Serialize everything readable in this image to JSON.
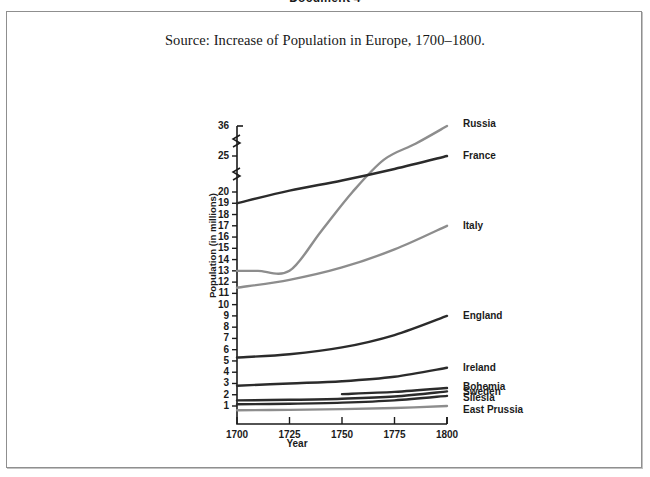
{
  "document": {
    "heading": "Document 4",
    "caption": "Source: Increase of Population in Europe, 1700–1800."
  },
  "chart_data": {
    "type": "line",
    "title": "Source: Increase of Population in Europe, 1700–1800.",
    "xlabel": "Year",
    "ylabel": "Population (in millions)",
    "xlim": [
      1700,
      1800
    ],
    "x_ticks": [
      "1700",
      "1725",
      "1750",
      "1775",
      "1800"
    ],
    "y_ticks": [
      "1",
      "2",
      "3",
      "4",
      "5",
      "6",
      "7",
      "8",
      "9",
      "10",
      "11",
      "12",
      "13",
      "14",
      "15",
      "16",
      "17",
      "18",
      "19",
      "20",
      "25",
      "36"
    ],
    "y_axis_breaks": [
      "between 20 and 25",
      "between 25 and 36"
    ],
    "grid": false,
    "legend_position": "right-of-line-ends",
    "series": [
      {
        "name": "Russia",
        "color": "#8d8d8d",
        "label_value": "36",
        "x": [
          1700,
          1710,
          1725,
          1740,
          1755,
          1770,
          1785,
          1800
        ],
        "values": [
          13,
          13,
          13,
          16.5,
          20,
          24.5,
          29.5,
          36
        ]
      },
      {
        "name": "France",
        "color": "#2b2b2b",
        "label_value": "25",
        "x": [
          1700,
          1725,
          1750,
          1775,
          1800
        ],
        "values": [
          19,
          20.2,
          21.6,
          23.2,
          25
        ]
      },
      {
        "name": "Italy",
        "color": "#8d8d8d",
        "label_value": "17",
        "x": [
          1700,
          1725,
          1750,
          1775,
          1800
        ],
        "values": [
          11.5,
          12.2,
          13.3,
          14.9,
          17
        ]
      },
      {
        "name": "England",
        "color": "#2b2b2b",
        "label_value": "9",
        "x": [
          1700,
          1725,
          1750,
          1775,
          1800
        ],
        "values": [
          5.3,
          5.6,
          6.2,
          7.3,
          9.0
        ]
      },
      {
        "name": "Ireland",
        "color": "#2b2b2b",
        "label_value": "4.4",
        "x": [
          1700,
          1725,
          1750,
          1775,
          1800
        ],
        "values": [
          2.8,
          3.0,
          3.2,
          3.6,
          4.4
        ]
      },
      {
        "name": "Bohemia",
        "color": "#2b2b2b",
        "label_value": "2.6",
        "x": [
          1750,
          1775,
          1800
        ],
        "values": [
          2.05,
          2.25,
          2.6
        ]
      },
      {
        "name": "Sweden",
        "color": "#2b2b2b",
        "label_value": "2.3",
        "x": [
          1700,
          1725,
          1750,
          1775,
          1800
        ],
        "values": [
          1.5,
          1.55,
          1.65,
          1.85,
          2.3
        ]
      },
      {
        "name": "Silesia",
        "color": "#2b2b2b",
        "label_value": "1.9",
        "x": [
          1700,
          1725,
          1750,
          1775,
          1800
        ],
        "values": [
          1.15,
          1.2,
          1.3,
          1.5,
          1.9
        ]
      },
      {
        "name": "East Prussia",
        "color": "#8d8d8d",
        "label_value": "1.0",
        "x": [
          1700,
          1725,
          1750,
          1775,
          1800
        ],
        "values": [
          0.62,
          0.66,
          0.72,
          0.82,
          1.0
        ]
      }
    ]
  },
  "axis": {
    "y_label": "Population (in millions)",
    "x_label": "Year"
  }
}
